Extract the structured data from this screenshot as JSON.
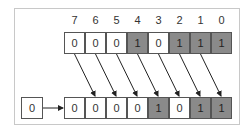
{
  "diagram": {
    "bit_labels": [
      "7",
      "6",
      "5",
      "4",
      "3",
      "2",
      "1",
      "0"
    ],
    "top_row": {
      "bits": [
        "0",
        "0",
        "0",
        "1",
        "0",
        "1",
        "1",
        "1"
      ]
    },
    "bottom_row": {
      "bits": [
        "0",
        "0",
        "0",
        "0",
        "1",
        "0",
        "1",
        "1"
      ]
    },
    "shift_in": {
      "value": "0"
    },
    "colors": {
      "set_bit_fill": "#8a8a8a",
      "clear_bit_fill": "#ffffff",
      "border": "#555555",
      "arrow": "#222222",
      "frame": "#c8c8c8"
    }
  }
}
